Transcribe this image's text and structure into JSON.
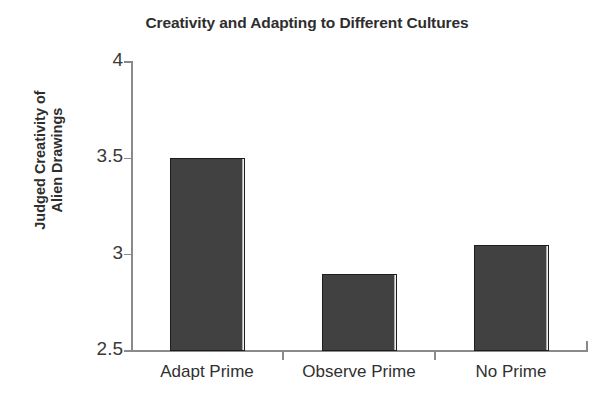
{
  "chart_data": {
    "type": "bar",
    "title": "Creativity and Adapting to Different Cultures",
    "xlabel": "",
    "ylabel": "Judged Creativity of\nAlien Drawings",
    "categories": [
      "Adapt Prime",
      "Observe Prime",
      "No Prime"
    ],
    "values": [
      3.5,
      2.9,
      3.05
    ],
    "ylim": [
      2.5,
      4
    ],
    "yticks": [
      2.5,
      3,
      3.5,
      4
    ],
    "ytick_labels": [
      "2.5",
      "3",
      "3.5",
      "4"
    ],
    "grid": false,
    "legend": null,
    "bar_color": "#414141",
    "bar_edge_color": "#1d1d1d",
    "axis_color": "#8a8a8a",
    "background_color": "#ffffff"
  }
}
